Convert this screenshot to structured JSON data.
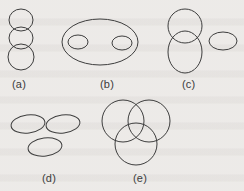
{
  "figure": {
    "kind": "set-relationship line diagram",
    "background_color": "#f3f1ef",
    "stroke_color": "#3d3d3d",
    "stroke_width": 1,
    "width": 244,
    "height": 191
  },
  "panels": [
    {
      "id": "a",
      "label": "(a)",
      "label_x": 12,
      "label_y": 78,
      "description": "chain of three vertically stacked overlapping ellipses",
      "shapes": [
        {
          "name": "ellipse-a-top",
          "cx": 21,
          "cy": 20,
          "rx": 12,
          "ry": 11,
          "rotate": 0
        },
        {
          "name": "ellipse-a-middle",
          "cx": 21,
          "cy": 38,
          "rx": 12,
          "ry": 11,
          "rotate": 0
        },
        {
          "name": "ellipse-a-bottom",
          "cx": 21,
          "cy": 57,
          "rx": 13,
          "ry": 13,
          "rotate": 0
        }
      ]
    },
    {
      "id": "b",
      "label": "(b)",
      "label_x": 100,
      "label_y": 78,
      "description": "one large ellipse containing two small disjoint ellipses",
      "shapes": [
        {
          "name": "ellipse-b-outer",
          "cx": 100,
          "cy": 42,
          "rx": 38,
          "ry": 23,
          "rotate": 0
        },
        {
          "name": "ellipse-b-inner-left",
          "cx": 78,
          "cy": 42,
          "rx": 10,
          "ry": 7,
          "rotate": 0
        },
        {
          "name": "ellipse-b-inner-right",
          "cx": 122,
          "cy": 43,
          "rx": 10,
          "ry": 7,
          "rotate": 0
        }
      ]
    },
    {
      "id": "c",
      "label": "(c)",
      "label_x": 182,
      "label_y": 78,
      "description": "two overlapping ellipses plus one separate ellipse",
      "shapes": [
        {
          "name": "ellipse-c-top",
          "cx": 185,
          "cy": 26,
          "rx": 17,
          "ry": 17,
          "rotate": 0
        },
        {
          "name": "ellipse-c-bottom",
          "cx": 185,
          "cy": 52,
          "rx": 17,
          "ry": 21,
          "rotate": 0
        },
        {
          "name": "ellipse-c-separate",
          "cx": 223,
          "cy": 41,
          "rx": 14,
          "ry": 9,
          "rotate": 0
        }
      ]
    },
    {
      "id": "d",
      "label": "(d)",
      "label_x": 42,
      "label_y": 172,
      "description": "three mutually disjoint tilted ellipses",
      "shapes": [
        {
          "name": "ellipse-d-top-left",
          "cx": 28,
          "cy": 124,
          "rx": 17,
          "ry": 9,
          "rotate": -7
        },
        {
          "name": "ellipse-d-top-right",
          "cx": 63,
          "cy": 124,
          "rx": 17,
          "ry": 9,
          "rotate": -7
        },
        {
          "name": "ellipse-d-bottom",
          "cx": 45,
          "cy": 147,
          "rx": 17,
          "ry": 9,
          "rotate": -7
        }
      ]
    },
    {
      "id": "e",
      "label": "(e)",
      "label_x": 133,
      "label_y": 172,
      "description": "three mutually overlapping circles forming a Venn diagram",
      "shapes": [
        {
          "name": "circle-e-top-left",
          "cx": 123,
          "cy": 121,
          "rx": 21,
          "ry": 21,
          "rotate": 0
        },
        {
          "name": "circle-e-top-right",
          "cx": 149,
          "cy": 121,
          "rx": 21,
          "ry": 21,
          "rotate": 0
        },
        {
          "name": "circle-e-bottom",
          "cx": 136,
          "cy": 144,
          "rx": 21,
          "ry": 21,
          "rotate": 0
        }
      ]
    }
  ]
}
